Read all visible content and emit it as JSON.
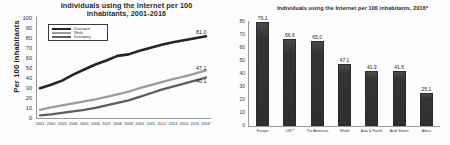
{
  "chart_data": [
    {
      "type": "line",
      "title": "Individuals using the Internet per 100 inhabitants, 2001-2016",
      "title_line1": "Individuals using the Internet per 100",
      "title_line2": "inhabitants, 2001-2016",
      "xlabel": "",
      "ylabel": "Per 100 inhabitants",
      "ylim": [
        0,
        100
      ],
      "ytick_labels": [
        "100",
        "90",
        "80",
        "70",
        "60",
        "50",
        "40",
        "30",
        "20",
        "10",
        "0"
      ],
      "categories": [
        "2001",
        "2002",
        "2003",
        "2004",
        "2005",
        "2006",
        "2007",
        "2008",
        "2009",
        "2010",
        "2011",
        "2012",
        "2013",
        "2014",
        "2015",
        "2016*"
      ],
      "grid": false,
      "legend_position": "upper-left",
      "series": [
        {
          "name": "Developed",
          "color": "#242424",
          "end_label": "81.0",
          "values": [
            29.5,
            33.0,
            37.0,
            43.0,
            48.0,
            53.0,
            57.0,
            61.5,
            63.0,
            66.5,
            69.5,
            72.5,
            75.0,
            77.0,
            79.0,
            81.0
          ]
        },
        {
          "name": "World",
          "color": "#9c9c9c",
          "end_label": "47.1",
          "values": [
            8.0,
            10.5,
            12.5,
            14.5,
            16.5,
            18.5,
            21.0,
            23.5,
            26.0,
            29.5,
            32.5,
            35.5,
            38.5,
            41.0,
            44.0,
            47.1
          ]
        },
        {
          "name": "Developing",
          "color": "#5e5e5e",
          "end_label": "40.1",
          "values": [
            2.5,
            3.5,
            5.0,
            6.5,
            8.0,
            10.0,
            12.5,
            15.0,
            17.5,
            21.0,
            24.5,
            28.0,
            31.0,
            34.0,
            37.0,
            40.1
          ]
        }
      ]
    },
    {
      "type": "bar",
      "title": "Individuals using the Internet per 100 inhabitants, 2016*",
      "xlabel": "",
      "ylabel": "",
      "ylim": [
        0,
        80
      ],
      "ytick_labels": [
        "80",
        "70",
        "60",
        "50",
        "40",
        "30",
        "20",
        "10",
        "0"
      ],
      "grid": false,
      "bar_color": "#333333",
      "categories": [
        "Europe",
        "CIS**",
        "The Americas",
        "World",
        "Asia & Pacific",
        "Arab States",
        "Africa"
      ],
      "values": [
        79.1,
        66.6,
        65.0,
        47.1,
        41.9,
        41.6,
        25.1
      ],
      "value_labels": [
        "79,1",
        "66,6",
        "65,0",
        "47,1",
        "41,9",
        "41,6",
        "25,1"
      ]
    }
  ]
}
